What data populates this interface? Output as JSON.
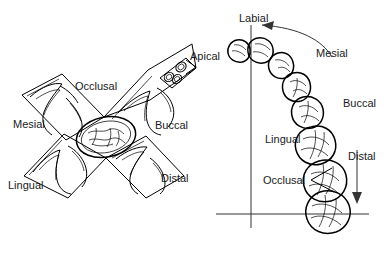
{
  "figure": {
    "panels": [
      {
        "id": "unfolded-tooth",
        "name": "Unfolded tooth cross diagram",
        "labels": [
          {
            "key": "occlusal",
            "text": "Occlusal",
            "x": 75,
            "y": 80
          },
          {
            "key": "mesial",
            "text": "Mesial",
            "x": 13,
            "y": 118
          },
          {
            "key": "buccal",
            "text": "Buccal",
            "x": 155,
            "y": 119
          },
          {
            "key": "lingual",
            "text": "Lingual",
            "x": 8,
            "y": 179
          },
          {
            "key": "distal",
            "text": "Distal",
            "x": 161,
            "y": 172
          },
          {
            "key": "apical",
            "text": "Apical",
            "x": 190,
            "y": 50
          }
        ]
      },
      {
        "id": "dental-arch",
        "name": "Dental arch quadrant diagram",
        "labels": [
          {
            "key": "labial",
            "text": "Labial",
            "x": 239,
            "y": 12
          },
          {
            "key": "mesial",
            "text": "Mesial",
            "x": 316,
            "y": 47
          },
          {
            "key": "buccal",
            "text": "Buccal",
            "x": 343,
            "y": 97
          },
          {
            "key": "lingual",
            "text": "Lingual",
            "x": 265,
            "y": 133
          },
          {
            "key": "distal",
            "text": "Distal",
            "x": 348,
            "y": 150
          },
          {
            "key": "occlusal",
            "text": "Occlusal",
            "x": 263,
            "y": 174
          }
        ]
      }
    ],
    "colors": {
      "ink": "#000000",
      "text": "#1a1a1a",
      "axis": "#333333",
      "background": "#ffffff"
    }
  }
}
